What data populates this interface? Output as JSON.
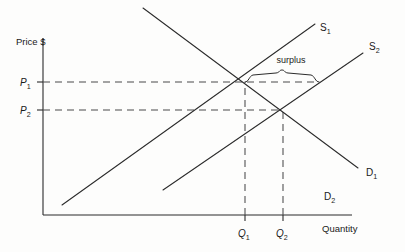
{
  "figure": {
    "kind": "supply-demand-surplus-diagram",
    "background_color": "#fdfdfc",
    "ink_color": "#2b2b2b"
  },
  "axes": {
    "y_axis_title": "Price $",
    "x_axis_title": "Quantity",
    "origin": {
      "x": 43,
      "y": 215
    },
    "y_axis_top": 38,
    "x_axis_right": 352
  },
  "price_levels": [
    {
      "id": "P1",
      "symbol": "P",
      "subscript": "1",
      "y": 82,
      "label_x": 22,
      "dash_from_x": 43,
      "dash_to_x": 318
    },
    {
      "id": "P2",
      "symbol": "P",
      "subscript": "2",
      "y": 110,
      "label_x": 22,
      "dash_from_x": 43,
      "dash_to_x": 283
    }
  ],
  "quantity_levels": [
    {
      "id": "Q1",
      "symbol": "Q",
      "subscript": "1",
      "x": 245,
      "label_y": 232,
      "dash_from_y": 215,
      "dash_to_y": 82
    },
    {
      "id": "Q2",
      "symbol": "Q",
      "subscript": "2",
      "x": 283,
      "label_y": 232,
      "dash_from_y": 215,
      "dash_to_y": 110
    }
  ],
  "curves": [
    {
      "id": "S1",
      "symbol": "S",
      "subscript": "1",
      "role": "supply",
      "label_x": 320,
      "label_y": 31,
      "from": {
        "x": 62,
        "y": 205
      },
      "to": {
        "x": 315,
        "y": 24
      }
    },
    {
      "id": "S2",
      "symbol": "S",
      "subscript": "2",
      "role": "supply",
      "label_x": 369,
      "label_y": 50,
      "from": {
        "x": 163,
        "y": 190
      },
      "to": {
        "x": 363,
        "y": 53
      }
    },
    {
      "id": "D1",
      "symbol": "D",
      "subscript": "1",
      "role": "demand",
      "label_x": 366,
      "label_y": 176,
      "from": {
        "x": 143,
        "y": 8
      },
      "to": {
        "x": 358,
        "y": 168
      }
    },
    {
      "id": "D2",
      "symbol": "D",
      "subscript": "2",
      "role": "demand-label-only",
      "label_x": 324,
      "label_y": 200,
      "from": null,
      "to": null
    }
  ],
  "equilibria": [
    {
      "id": "E1",
      "x": 245,
      "y": 82,
      "curves": [
        "S1",
        "D1"
      ]
    },
    {
      "id": "E2",
      "x": 283,
      "y": 110,
      "curves": [
        "S2",
        "D1"
      ]
    }
  ],
  "annotations": [
    {
      "id": "surplus",
      "text": "surplus",
      "text_x": 291,
      "text_y": 63,
      "brace": {
        "left_x": 245,
        "right_x": 318,
        "y": 82,
        "tip_y": 71,
        "height": 9
      }
    }
  ]
}
